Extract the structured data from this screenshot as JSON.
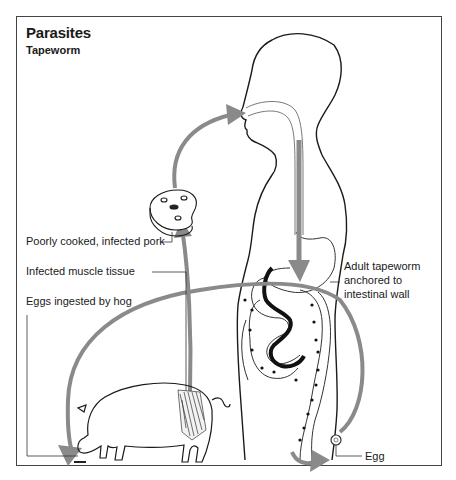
{
  "header": {
    "title": "Parasites",
    "subtitle": "Tapeworm"
  },
  "labels": {
    "pork": "Poorly cooked, infected pork",
    "muscle": "Infected muscle tissue",
    "eggs_ingested": "Eggs ingested by hog",
    "adult_line1": "Adult tapeworm",
    "adult_line2": "anchored to",
    "adult_line3": "intestinal wall",
    "egg": "Egg"
  },
  "colors": {
    "arrow": "#8a8a8a",
    "outline": "#1a1a1a",
    "frame": "#444444"
  }
}
